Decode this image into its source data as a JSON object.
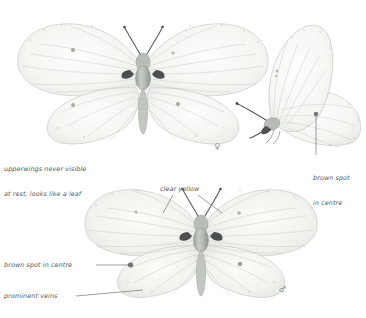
{
  "plate": {
    "title": "Brimstone butterfly field-guide plate",
    "background_color": "#ffffff",
    "label_color": "#55595c",
    "leader_color": "#6f7478",
    "spot_color": "#8a8276",
    "wing_fill_female": "#f4f6f3",
    "wing_fill_male": "#f2f3ef",
    "wing_edge": "#c9cdc8",
    "vein_color": "#c2c7c3",
    "body_color": "#b3b7b3"
  },
  "specimens": [
    {
      "id": "female-upperside",
      "name": "female-butterfly-upperside",
      "sex_symbol": "♀",
      "sex_label": "female"
    },
    {
      "id": "side-profile",
      "name": "butterfly-side-profile",
      "sex_symbol": "",
      "sex_label": "resting profile"
    },
    {
      "id": "male-upperside",
      "name": "male-butterfly-upperside",
      "sex_symbol": "♂",
      "sex_label": "male"
    }
  ],
  "annotations": {
    "upperwings": {
      "line1": "upperwings never visible",
      "line2": "at rest, looks like a leaf"
    },
    "brown_spot_side": {
      "line1": "brown spot",
      "line2": "in centre"
    },
    "clear_yellow": {
      "text": "clear yellow"
    },
    "brown_spot_male": {
      "text": "brown spot in centre"
    },
    "prominent_veins": {
      "text": "prominent veins"
    }
  }
}
